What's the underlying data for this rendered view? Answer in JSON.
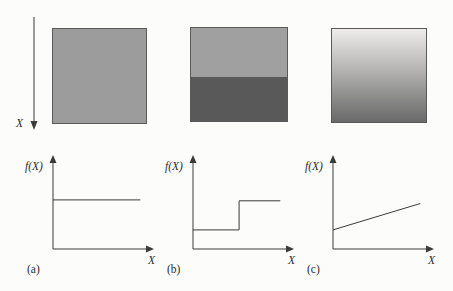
{
  "figure": {
    "left_axis_label": "X",
    "colors": {
      "bg": "#fcfcfb",
      "text": "#2b2b2b",
      "line": "#3a3a3a",
      "border": "#5a5a5a",
      "sq_a_fill": "#9c9c9c",
      "sq_b_top": "#a0a0a0",
      "sq_b_bottom": "#595959",
      "sq_c_top": "#eeedeb",
      "sq_c_bottom": "#696969"
    },
    "squares": [
      {
        "name": "uniform-gray-square"
      },
      {
        "name": "two-tone-square"
      },
      {
        "name": "gradient-square"
      }
    ]
  },
  "chart_data": [
    {
      "type": "line",
      "panel_label": "(a)",
      "ylabel": "f(X)",
      "xlabel": "X",
      "profile": "constant",
      "xlim": [
        0,
        1
      ],
      "ylim": [
        0,
        1
      ],
      "grid": false,
      "points": [
        [
          0,
          0.54
        ],
        [
          0.9,
          0.54
        ]
      ]
    },
    {
      "type": "line",
      "panel_label": "(b)",
      "ylabel": "f(X)",
      "xlabel": "X",
      "profile": "step",
      "xlim": [
        0,
        1
      ],
      "ylim": [
        0,
        1
      ],
      "grid": false,
      "points": [
        [
          0,
          0.21
        ],
        [
          0.475,
          0.21
        ],
        [
          0.475,
          0.53
        ],
        [
          0.9,
          0.53
        ]
      ]
    },
    {
      "type": "line",
      "panel_label": "(c)",
      "ylabel": "f(X)",
      "xlabel": "X",
      "profile": "ramp",
      "xlim": [
        0,
        1
      ],
      "ylim": [
        0,
        1
      ],
      "grid": false,
      "points": [
        [
          0,
          0.21
        ],
        [
          0.9,
          0.5
        ]
      ]
    }
  ]
}
